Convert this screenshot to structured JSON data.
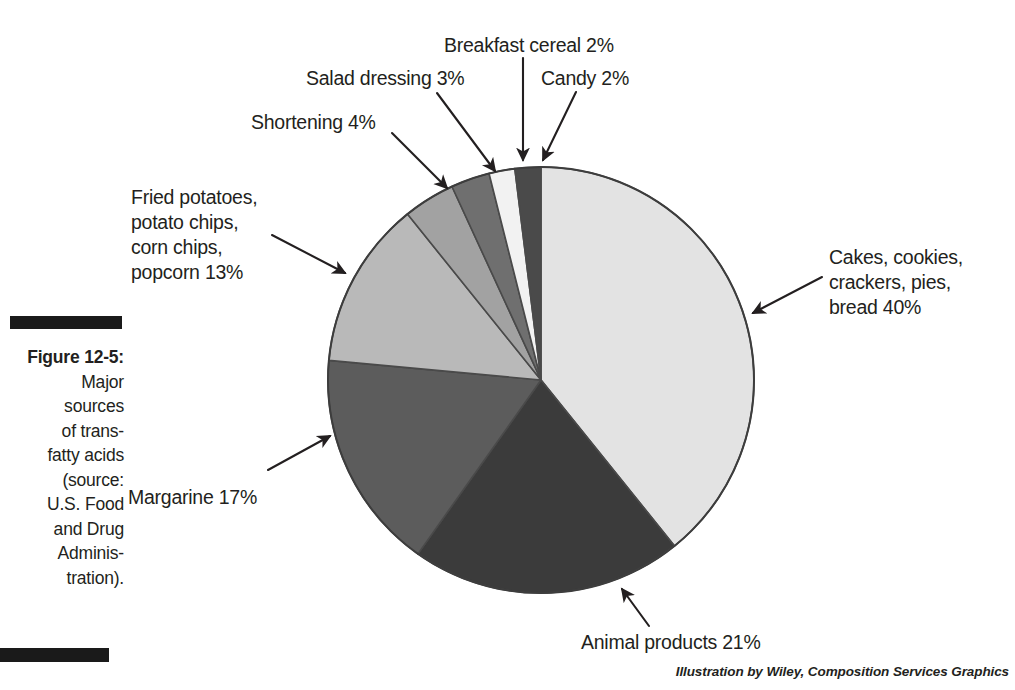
{
  "figure": {
    "caption_lines": [
      "Figure 12-5:",
      "Major",
      "sources",
      "of trans-",
      "fatty acids",
      "(source:",
      "U.S. Food",
      "and Drug",
      "Adminis-",
      "tration)."
    ],
    "credit": "Illustration by Wiley, Composition Services Graphics"
  },
  "chart_data": {
    "type": "pie",
    "source": "U.S. Food and Drug Administration",
    "unit": "percent",
    "start_angle_deg": 0,
    "direction": "clockwise",
    "center": {
      "x": 541,
      "y": 380
    },
    "radius": 213,
    "categories": [
      "Cakes, cookies, crackers, pies, bread",
      "Animal products",
      "Margarine",
      "Fried potatoes, potato chips, corn chips, popcorn",
      "Shortening",
      "Salad dressing",
      "Breakfast cereal",
      "Candy"
    ],
    "values": [
      40,
      21,
      17,
      13,
      4,
      3,
      2,
      2
    ],
    "colors": [
      "#e3e3e3",
      "#3b3b3b",
      "#5c5c5c",
      "#b9b9b9",
      "#a2a2a2",
      "#6f6f6f",
      "#f2f2f2",
      "#4a4a4a"
    ],
    "slices": [
      {
        "label": "Cakes, cookies, crackers, pies, bread",
        "value": 40,
        "color": "#e3e3e3"
      },
      {
        "label": "Animal products",
        "value": 21,
        "color": "#3b3b3b"
      },
      {
        "label": "Margarine",
        "value": 17,
        "color": "#5c5c5c"
      },
      {
        "label": "Fried potatoes, potato chips, corn chips, popcorn",
        "value": 13,
        "color": "#b9b9b9"
      },
      {
        "label": "Shortening",
        "value": 4,
        "color": "#a2a2a2"
      },
      {
        "label": "Salad dressing",
        "value": 3,
        "color": "#6f6f6f"
      },
      {
        "label": "Breakfast cereal",
        "value": 2,
        "color": "#f2f2f2"
      },
      {
        "label": "Candy",
        "value": 2,
        "color": "#4a4a4a"
      }
    ]
  },
  "labels": {
    "breakfast_cereal": {
      "lines": [
        "Breakfast cereal 2%"
      ]
    },
    "candy": {
      "lines": [
        "Candy 2%"
      ]
    },
    "salad_dressing": {
      "lines": [
        "Salad dressing 3%"
      ]
    },
    "shortening": {
      "lines": [
        "Shortening 4%"
      ]
    },
    "fried_potatoes": {
      "lines": [
        "Fried potatoes,",
        "potato chips,",
        "corn chips,",
        "popcorn 13%"
      ]
    },
    "cakes": {
      "lines": [
        "Cakes, cookies,",
        "crackers, pies,",
        "bread 40%"
      ]
    },
    "margarine": {
      "lines": [
        "Margarine 17%"
      ]
    },
    "animal_products": {
      "lines": [
        "Animal products 21%"
      ]
    }
  }
}
